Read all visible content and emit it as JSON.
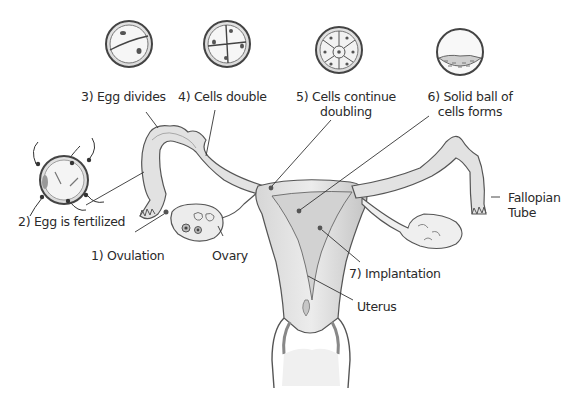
{
  "stages": [
    {
      "id": 1,
      "label": "1) Ovulation"
    },
    {
      "id": 2,
      "label": "2) Egg is fertilized"
    },
    {
      "id": 3,
      "label": "3) Egg divides"
    },
    {
      "id": 4,
      "label": "4) Cells double"
    },
    {
      "id": 5,
      "label_line1": "5) Cells continue",
      "label_line2": "doubling"
    },
    {
      "id": 6,
      "label_line1": "6) Solid ball of",
      "label_line2": "cells forms"
    },
    {
      "id": 7,
      "label": "7) Implantation"
    }
  ],
  "anatomy": {
    "ovary": "Ovary",
    "uterus": "Uterus",
    "fallopian_tube_line1": "Fallopian",
    "fallopian_tube_line2": "Tube"
  },
  "colors": {
    "ink": "#3a3a3a",
    "tissue_fill": "#e4e4e4",
    "tissue_shade": "#bdbdbd",
    "cell_fill": "#f4f4f4",
    "nucleus": "#555555",
    "background": "#ffffff"
  }
}
